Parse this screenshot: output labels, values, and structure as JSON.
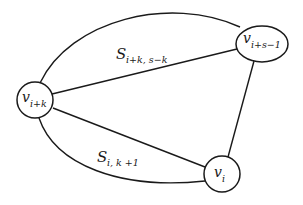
{
  "diagram": {
    "type": "graph",
    "nodes": [
      {
        "id": "v_ik",
        "label_main": "v",
        "label_sub": "i+k"
      },
      {
        "id": "v_is1",
        "label_main": "v",
        "label_sub": "i+s−1"
      },
      {
        "id": "v_i",
        "label_main": "v",
        "label_sub": "i"
      }
    ],
    "edges": [
      {
        "from": "v_ik",
        "to": "v_is1",
        "shape": "arc-top"
      },
      {
        "from": "v_ik",
        "to": "v_is1",
        "shape": "line"
      },
      {
        "from": "v_ik",
        "to": "v_i",
        "shape": "line"
      },
      {
        "from": "v_ik",
        "to": "v_i",
        "shape": "arc-bottom"
      },
      {
        "from": "v_is1",
        "to": "v_i",
        "shape": "line"
      }
    ],
    "region_labels": [
      {
        "id": "S_top",
        "main": "S",
        "sub": "i+k, s−k"
      },
      {
        "id": "S_bottom",
        "main": "S",
        "sub": "i, k +1"
      }
    ]
  }
}
